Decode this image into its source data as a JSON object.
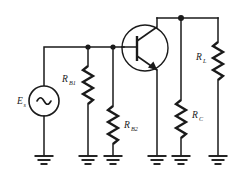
{
  "diagram": {
    "background_color": "#ffffff",
    "line_color": "#1a1a1a"
  },
  "components": {
    "source": {
      "name": "ac-voltage-source",
      "label_main": "E",
      "label_sub": "s",
      "symbol": "sine-wave-ac-source"
    },
    "rb1": {
      "name": "resistor-rb1",
      "label_main": "R",
      "label_sub": "B1",
      "symbol": "zigzag-resistor"
    },
    "rb2": {
      "name": "resistor-rb2",
      "label_main": "R",
      "label_sub": "B2",
      "symbol": "zigzag-resistor"
    },
    "rc": {
      "name": "resistor-rc",
      "label_main": "R",
      "label_sub": "C",
      "symbol": "zigzag-resistor"
    },
    "rl": {
      "name": "resistor-rl",
      "label_main": "R",
      "label_sub": "L",
      "symbol": "zigzag-resistor"
    },
    "transistor": {
      "name": "npn-transistor",
      "type": "NPN",
      "symbol": "bjt-npn-circle"
    }
  },
  "grounds": [
    {
      "name": "ground-source"
    },
    {
      "name": "ground-rb1"
    },
    {
      "name": "ground-rb2"
    },
    {
      "name": "ground-emitter"
    },
    {
      "name": "ground-rc"
    },
    {
      "name": "ground-rl"
    }
  ],
  "nodes": [
    {
      "name": "node-base-rb1"
    },
    {
      "name": "node-base-rb2"
    },
    {
      "name": "node-collector-top"
    }
  ]
}
